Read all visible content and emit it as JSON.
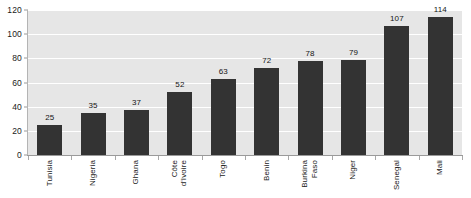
{
  "chart_data": {
    "type": "bar",
    "title": "",
    "subtitle": "",
    "xlabel": "",
    "ylabel": "",
    "ylim": [
      0,
      120
    ],
    "ytick_step": 20,
    "yticks": [
      120,
      100,
      80,
      60,
      40,
      20,
      0
    ],
    "grid": "horizontal",
    "legend": "none",
    "orientation": "vertical",
    "bar_color": "#333333",
    "plot_background": "#e6e6e6",
    "gridline_color": "#ffffff",
    "categories": [
      "Tunisia",
      "Nigeria",
      "Ghana",
      "Côte d'Ivoire",
      "Togo",
      "Benin",
      "Burkina Faso",
      "Niger",
      "Senegal",
      "Mali"
    ],
    "category_label_lines": [
      [
        "Tunisia"
      ],
      [
        "Nigeria"
      ],
      [
        "Ghana"
      ],
      [
        "Côte",
        "d'Ivoire"
      ],
      [
        "Togo"
      ],
      [
        "Benin"
      ],
      [
        "Burkina",
        "Faso"
      ],
      [
        "Niger"
      ],
      [
        "Senegal"
      ],
      [
        "Mali"
      ]
    ],
    "values": [
      25,
      35,
      37,
      52,
      63,
      72,
      78,
      79,
      107,
      114
    ],
    "data_labels": [
      "25",
      "35",
      "37",
      "52",
      "63",
      "72",
      "78",
      "79",
      "107",
      "114"
    ]
  }
}
